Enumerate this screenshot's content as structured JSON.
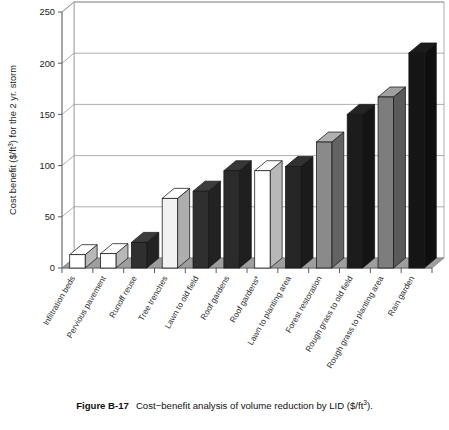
{
  "figure": {
    "caption_label": "Figure B-17",
    "caption_text": "Cost−benefit analysis of volume reduction by LID ($/ft",
    "caption_sup": "3",
    "caption_tail": ")."
  },
  "chart_data": {
    "type": "bar",
    "title": "",
    "xlabel": "",
    "ylabel": "Cost benefit ($/ft³) for the 2 yr. storm",
    "ylabel_prefix": "Cost benefit ($/ft",
    "ylabel_sup": "3",
    "ylabel_suffix": ") for the 2 yr. storm",
    "ylim": [
      0,
      250
    ],
    "yticks": [
      0,
      50,
      100,
      150,
      200,
      250
    ],
    "ytick_labels": [
      "0",
      "50",
      "100",
      "150",
      "200",
      "250"
    ],
    "grid": true,
    "legend": "none",
    "style": "3d-column",
    "categories": [
      "Infiltration beds",
      "Pervious pavement",
      "Runoff reuse",
      "Tree trenches",
      "Lawn to old field",
      "Roof gardens",
      "Roof gardens*",
      "Lawn to planting area",
      "Forest restoration",
      "Rough grass to old field",
      "Rough grass to planting area",
      "Rain garden"
    ],
    "values": [
      13,
      14,
      25,
      68,
      75,
      95,
      95,
      99,
      123,
      150,
      167,
      210
    ],
    "bar_shades": [
      "#ffffff",
      "#ffffff",
      "#2f2f2f",
      "#f2f2f2",
      "#2f2f2f",
      "#2b2b2b",
      "#ffffff",
      "#262626",
      "#8a8a8a",
      "#1c1c1c",
      "#7d7d7d",
      "#151515"
    ],
    "note": "Label 7 carries an asterisk (Roof gardens*); label 8 reads 'Roof gardens with SW storage' in the original plate",
    "categories_long": [
      "Infiltration beds",
      "Pervious pavement",
      "Runoff reuse",
      "Tree trenches",
      "Lawn to old field",
      "Roof gardens",
      "Roof gardens*",
      "Roof gardens with SW storage",
      "Lawn to planting area",
      "Forest restoration",
      "Rough grass to old field",
      "Rough grass to planting area",
      "Rain garden"
    ]
  },
  "colors": {
    "background": "#ffffff",
    "floor": "#9e9e9e",
    "gridline": "#8d8d8d",
    "axis": "#6e6e6e",
    "text": "#111111"
  }
}
